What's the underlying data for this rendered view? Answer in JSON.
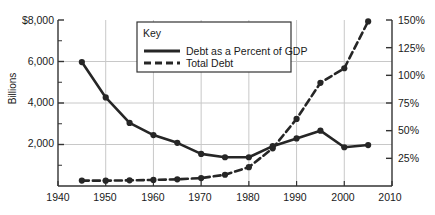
{
  "chart_data": {
    "type": "line",
    "title": "",
    "xlabel": "",
    "ylabel": "Billions",
    "ylabel_right": "",
    "x": [
      1945,
      1950,
      1955,
      1960,
      1965,
      1970,
      1975,
      1980,
      1985,
      1990,
      1995,
      2000,
      2005
    ],
    "xlim": [
      1940,
      2010
    ],
    "xticks": [
      "1940",
      "1950",
      "1960",
      "1970",
      "1980",
      "1990",
      "2000",
      "2010"
    ],
    "xtick_values": [
      1940,
      1950,
      1960,
      1970,
      1980,
      1990,
      2000,
      2010
    ],
    "ylim": [
      0,
      8000
    ],
    "yticks": [
      "$8,000",
      "6,000",
      "4,000",
      "2,000"
    ],
    "ytick_values": [
      8000,
      6000,
      4000,
      2000
    ],
    "ylim_right": [
      0,
      150
    ],
    "yticks_right": [
      "150%",
      "125%",
      "100%",
      "75%",
      "50%",
      "25%"
    ],
    "ytick_values_right": [
      150,
      125,
      100,
      75,
      50,
      25
    ],
    "grid": true,
    "legend_position": "top-center",
    "series": [
      {
        "name": "Debt as a Percent of GDP",
        "style": "solid",
        "axis": "right",
        "unit": "percent",
        "values": [
          112,
          80,
          57,
          46,
          39,
          29,
          26,
          26,
          36,
          43,
          50,
          35,
          37
        ]
      },
      {
        "name": "Total Debt",
        "style": "dashed",
        "axis": "left",
        "unit": "billions",
        "values": [
          260,
          257,
          274,
          291,
          322,
          381,
          542,
          909,
          1817,
          3233,
          4974,
          5674,
          7933
        ]
      }
    ]
  },
  "legend": {
    "title": "Key",
    "entries": [
      {
        "label": "Debt as a Percent of GDP",
        "style": "solid"
      },
      {
        "label": "Total Debt",
        "style": "dashed"
      }
    ]
  },
  "colors": {
    "line": "#262626",
    "axis": "#333333",
    "grid": "#c8c8c8",
    "background": "#ffffff"
  }
}
